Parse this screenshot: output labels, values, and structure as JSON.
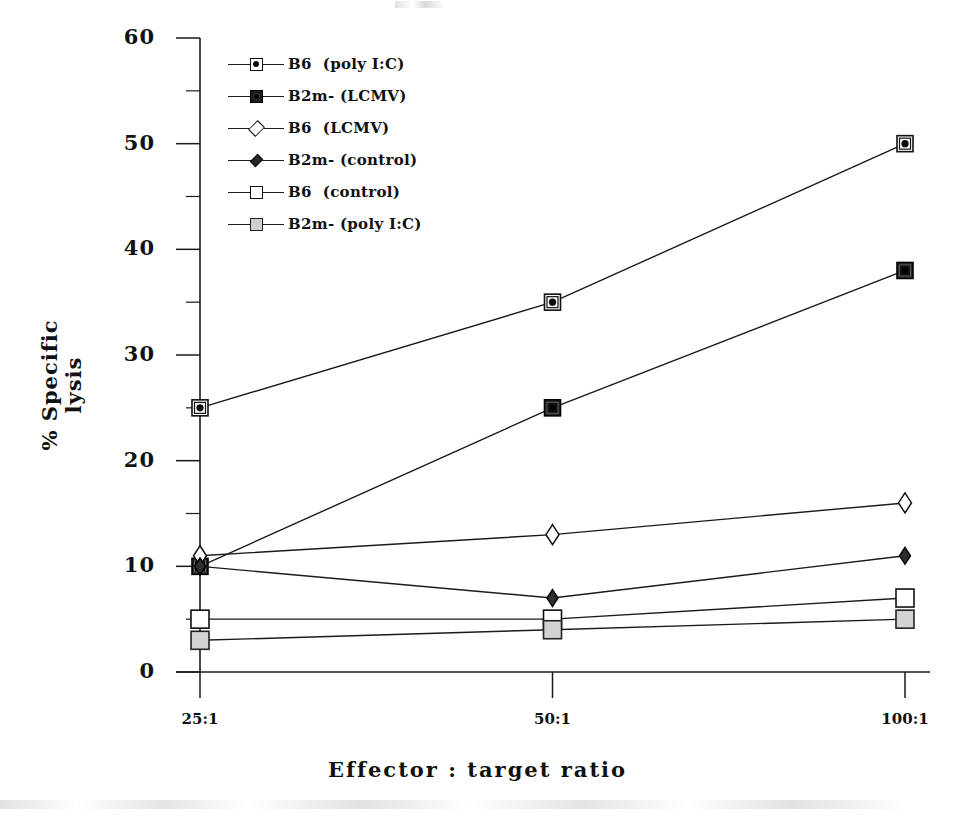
{
  "chart_data": {
    "type": "line",
    "title": "",
    "xlabel": "Effector : target ratio",
    "ylabel": "% Specific\nlysis",
    "ylabel_line1": "% Specific",
    "ylabel_line2": "lysis",
    "categories": [
      "25:1",
      "50:1",
      "100:1"
    ],
    "x_tick_labels": [
      "25:1",
      "50:1",
      "100:1"
    ],
    "y_tick_labels": [
      "0",
      "10",
      "20",
      "30",
      "40",
      "50",
      "60"
    ],
    "y_major_ticks": [
      0,
      10,
      20,
      30,
      40,
      50,
      60
    ],
    "y_minor_ticks": [
      5,
      15,
      25,
      35,
      45,
      55
    ],
    "ylim": [
      0,
      60
    ],
    "grid": false,
    "legend_position": "upper-left-inside",
    "series": [
      {
        "name": "B6 (poly I:C)",
        "marker": "square-with-dot",
        "values": [
          25,
          35,
          50
        ]
      },
      {
        "name": "B2m- (LCMV)",
        "marker": "filled-square",
        "values": [
          10,
          25,
          38
        ]
      },
      {
        "name": "B6 (LCMV)",
        "marker": "open-diamond",
        "values": [
          11,
          13,
          16
        ]
      },
      {
        "name": "B2m- (control)",
        "marker": "filled-diamond",
        "values": [
          10,
          7,
          11
        ]
      },
      {
        "name": "B6 (control)",
        "marker": "open-square",
        "values": [
          5,
          5,
          7
        ]
      },
      {
        "name": "B2m- (poly I:C)",
        "marker": "gray-square",
        "values": [
          3,
          4,
          5
        ]
      }
    ]
  },
  "legend": {
    "entries": [
      {
        "label": "B6  (poly I:C)",
        "marker": "square-with-dot"
      },
      {
        "label": "B2m- (LCMV)",
        "marker": "filled-square"
      },
      {
        "label": "B6  (LCMV)",
        "marker": "open-diamond"
      },
      {
        "label": "B2m- (control)",
        "marker": "filled-diamond"
      },
      {
        "label": "B6  (control)",
        "marker": "open-square"
      },
      {
        "label": "B2m- (poly I:C)",
        "marker": "gray-square"
      }
    ]
  },
  "axes": {
    "y_label_line1": "% Specific",
    "y_label_line2": "lysis",
    "x_label": "Effector : target ratio",
    "y_ticks": [
      {
        "value": 60,
        "label": "60"
      },
      {
        "value": 50,
        "label": "50"
      },
      {
        "value": 40,
        "label": "40"
      },
      {
        "value": 30,
        "label": "30"
      },
      {
        "value": 20,
        "label": "20"
      },
      {
        "value": 10,
        "label": "10"
      },
      {
        "value": 0,
        "label": "0"
      }
    ],
    "x_ticks": [
      {
        "value": "25:1",
        "label": "25:1"
      },
      {
        "value": "50:1",
        "label": "50:1"
      },
      {
        "value": "100:1",
        "label": "100:1"
      }
    ]
  },
  "colors": {
    "ink": "#111111",
    "line": "#1a1a1a",
    "background": "#ffffff",
    "marker_fill_light": "#ffffff",
    "marker_fill_dark": "#1b1b1b",
    "marker_fill_gray": "#cfcfcf"
  }
}
